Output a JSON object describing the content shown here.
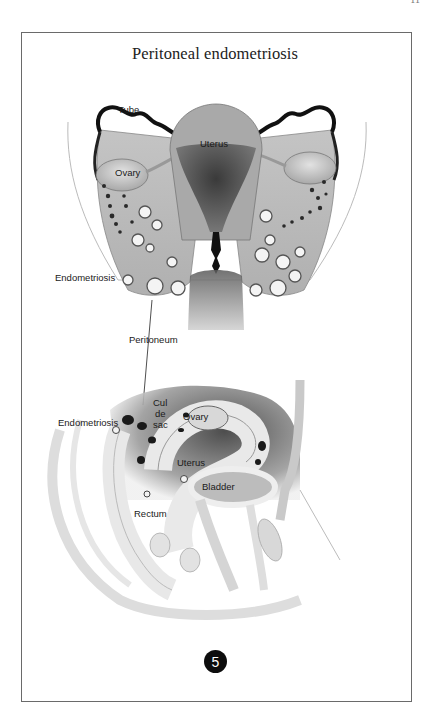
{
  "page": {
    "number": "11"
  },
  "figure": {
    "title": "Peritoneal endometriosis",
    "number": "5",
    "upper_view": {
      "labels": {
        "tube": "Tube",
        "uterus": "Uterus",
        "ovary": "Ovary",
        "endometriosis": "Endometriosis",
        "peritoneum": "Peritoneum"
      }
    },
    "lower_view": {
      "labels": {
        "endometriosis": "Endometriosis",
        "cul": "Cul",
        "de": "de",
        "sac": "sac",
        "ovary": "Ovary",
        "uterus": "Uterus",
        "bladder": "Bladder",
        "rectum": "Rectum"
      }
    }
  }
}
